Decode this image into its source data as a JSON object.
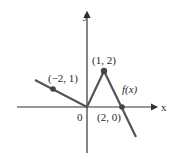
{
  "figure": {
    "axes": {
      "x_label": "x",
      "y_label": "y",
      "origin_label": "0"
    },
    "function_label": "f(x)",
    "points": [
      {
        "label": "(−2, 1)",
        "x": -2,
        "y": 1
      },
      {
        "label": "(1, 2)",
        "x": 1,
        "y": 2
      },
      {
        "label": "(2, 0)",
        "x": 2,
        "y": 0
      }
    ],
    "colors": {
      "line": "#555555",
      "axis": "#333333",
      "point": "#444444"
    }
  }
}
